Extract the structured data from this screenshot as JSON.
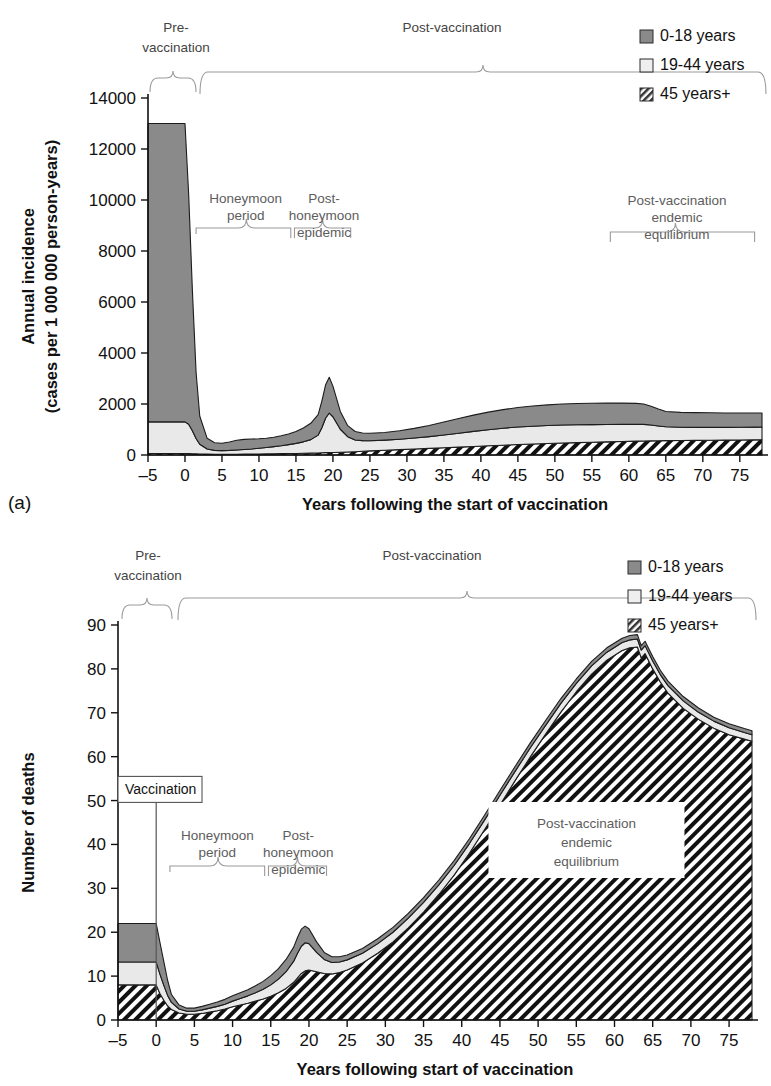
{
  "figure": {
    "panels": [
      {
        "id": "a",
        "label": "(a)",
        "xlabel": "Years following the start of vaccination",
        "ylabel_line1": "Annual incidence",
        "ylabel_line2": "(cases per 1 000 000 person-years)",
        "yticks": [
          0,
          2000,
          4000,
          6000,
          8000,
          10000,
          12000,
          14000
        ],
        "xticks": [
          -5,
          0,
          5,
          10,
          15,
          20,
          25,
          30,
          35,
          40,
          45,
          50,
          55,
          60,
          65,
          70,
          75
        ],
        "annotations": {
          "pre": "Pre-\nvaccination",
          "pre_l1": "Pre-",
          "pre_l2": "vaccination",
          "post": "Post-vaccination",
          "honeymoon_l1": "Honeymoon",
          "honeymoon_l2": "period",
          "posthoney_l1": "Post-",
          "posthoney_l2": "honeymoon",
          "posthoney_l3": "epidemic",
          "endemic_l1": "Post-vaccination",
          "endemic_l2": "endemic",
          "endemic_l3": "equilibrium"
        }
      },
      {
        "id": "b",
        "label": "(b)",
        "xlabel": "Years following start of vaccination",
        "ylabel": "Number of deaths",
        "yticks": [
          0,
          10,
          20,
          30,
          40,
          50,
          60,
          70,
          80,
          90
        ],
        "xticks": [
          -5,
          0,
          5,
          10,
          15,
          20,
          25,
          30,
          35,
          40,
          45,
          50,
          55,
          60,
          65,
          70,
          75
        ],
        "annotations": {
          "pre_l1": "Pre-",
          "pre_l2": "vaccination",
          "post": "Post-vaccination",
          "vaccination_box": "Vaccination",
          "honeymoon_l1": "Honeymoon",
          "honeymoon_l2": "period",
          "posthoney_l1": "Post-",
          "posthoney_l2": "honeymoon",
          "posthoney_l3": "epidemic",
          "endemic_l1": "Post-vaccination",
          "endemic_l2": "endemic",
          "endemic_l3": "equilibrium"
        }
      }
    ],
    "legend": {
      "items": [
        {
          "label": "0-18 years",
          "swatch": "solid-gray",
          "color": "#8a8a8a"
        },
        {
          "label": "19-44 years",
          "swatch": "empty-white",
          "color": "#ececec"
        },
        {
          "label": "45 years+",
          "swatch": "hatched",
          "color": "#ffffff"
        }
      ]
    },
    "colors": {
      "series_0_18": "#8a8a8a",
      "series_19_44": "#e9e9e9",
      "series_45_plus": "#ffffff",
      "hatch_stroke": "#111111",
      "axis": "#111111",
      "annotation_text": "#5d5d5d"
    }
  },
  "chart_data": [
    {
      "type": "area",
      "stacked": true,
      "panel": "a",
      "title": "",
      "xlabel": "Years following the start of vaccination",
      "ylabel": "Annual incidence (cases per 1 000 000 person-years)",
      "xlim": [
        -5,
        78
      ],
      "ylim": [
        0,
        14000
      ],
      "grid": false,
      "legend_position": "top-right",
      "x": [
        -5,
        -4,
        -3,
        -2,
        -1,
        0,
        0.5,
        1,
        1.5,
        2,
        3,
        4,
        5,
        6,
        7,
        8,
        9,
        10,
        11,
        12,
        13,
        14,
        15,
        16,
        17,
        18,
        18.5,
        19,
        19.5,
        20,
        21,
        22,
        23,
        24,
        25,
        27,
        29,
        31,
        33,
        35,
        37,
        39,
        41,
        43,
        45,
        47,
        49,
        51,
        53,
        55,
        57,
        59,
        61,
        62,
        63,
        64,
        65,
        67,
        69,
        71,
        73,
        75,
        77,
        78
      ],
      "series": [
        {
          "name": "45 years+",
          "swatch": "hatched",
          "values": [
            60,
            60,
            60,
            60,
            60,
            60,
            55,
            50,
            45,
            40,
            35,
            30,
            30,
            30,
            32,
            34,
            36,
            40,
            44,
            48,
            52,
            56,
            60,
            66,
            72,
            80,
            86,
            92,
            96,
            100,
            110,
            120,
            130,
            145,
            160,
            185,
            210,
            235,
            260,
            285,
            310,
            335,
            360,
            385,
            410,
            430,
            450,
            470,
            485,
            500,
            515,
            530,
            545,
            550,
            555,
            560,
            565,
            570,
            575,
            580,
            585,
            590,
            595,
            600
          ]
        },
        {
          "name": "19-44 years",
          "swatch": "empty-white",
          "values": [
            1240,
            1240,
            1240,
            1240,
            1240,
            1240,
            1150,
            900,
            600,
            380,
            200,
            150,
            140,
            150,
            165,
            180,
            200,
            225,
            250,
            280,
            310,
            350,
            395,
            450,
            530,
            700,
            980,
            1350,
            1550,
            1400,
            900,
            600,
            460,
            420,
            400,
            400,
            410,
            430,
            460,
            500,
            545,
            590,
            630,
            665,
            690,
            700,
            705,
            705,
            700,
            690,
            680,
            670,
            660,
            650,
            620,
            580,
            540,
            520,
            510,
            505,
            500,
            500,
            500,
            500
          ]
        },
        {
          "name": "0-18 years",
          "swatch": "solid-gray",
          "values": [
            11700,
            11700,
            11700,
            11700,
            11700,
            11700,
            9000,
            5500,
            2600,
            1100,
            420,
            300,
            290,
            330,
            380,
            400,
            390,
            370,
            360,
            370,
            390,
            420,
            470,
            540,
            640,
            800,
            1050,
            1300,
            1400,
            1200,
            700,
            430,
            330,
            300,
            290,
            300,
            330,
            380,
            440,
            510,
            580,
            640,
            690,
            730,
            760,
            790,
            810,
            825,
            835,
            840,
            840,
            835,
            820,
            800,
            740,
            660,
            600,
            580,
            575,
            570,
            565,
            560,
            555,
            550
          ]
        }
      ],
      "annotations": [
        {
          "text": "Pre-vaccination",
          "x_span": [
            -5.5,
            1.5
          ],
          "type": "brace-top"
        },
        {
          "text": "Post-vaccination",
          "x_span": [
            1.5,
            78
          ],
          "type": "brace-top"
        },
        {
          "text": "Honeymoon period",
          "x_span": [
            2,
            15
          ],
          "type": "brace-inner",
          "y": 6800
        },
        {
          "text": "Post-honeymoon epidemic",
          "x_span": [
            15,
            22
          ],
          "type": "brace-inner",
          "y": 6800
        },
        {
          "text": "Post-vaccination endemic equilibrium",
          "x_span": [
            57,
            78
          ],
          "type": "brace-inner",
          "y": 6900
        }
      ]
    },
    {
      "type": "area",
      "stacked": true,
      "panel": "b",
      "title": "",
      "xlabel": "Years following start of vaccination",
      "ylabel": "Number of deaths",
      "xlim": [
        -5,
        78
      ],
      "ylim": [
        0,
        90
      ],
      "grid": false,
      "legend_position": "top-right",
      "x": [
        -5,
        -4,
        -3,
        -2,
        -1,
        0,
        0.5,
        1,
        1.5,
        2,
        3,
        4,
        5,
        6,
        7,
        8,
        9,
        10,
        11,
        12,
        13,
        14,
        15,
        16,
        17,
        18,
        18.5,
        19,
        19.5,
        20,
        21,
        22,
        23,
        24,
        25,
        27,
        29,
        31,
        33,
        35,
        37,
        39,
        41,
        43,
        45,
        47,
        49,
        51,
        53,
        55,
        57,
        59,
        61,
        62,
        63,
        63.5,
        64,
        65,
        66,
        67,
        69,
        71,
        73,
        75,
        77,
        78
      ],
      "series": [
        {
          "name": "45 years+",
          "swatch": "hatched",
          "values": [
            8.0,
            8.0,
            8.0,
            8.0,
            8.0,
            8.0,
            6.0,
            4.5,
            3.2,
            2.4,
            1.6,
            1.3,
            1.3,
            1.5,
            1.8,
            2.1,
            2.5,
            3.0,
            3.4,
            3.8,
            4.3,
            4.8,
            5.4,
            6.2,
            7.2,
            8.6,
            9.6,
            10.6,
            11.2,
            11.4,
            11.0,
            10.6,
            10.5,
            10.8,
            11.4,
            13.0,
            15.2,
            17.8,
            21.0,
            24.6,
            28.6,
            33.0,
            38.0,
            43.4,
            49.0,
            54.6,
            60.0,
            65.2,
            70.2,
            74.8,
            78.8,
            82.0,
            84.2,
            84.8,
            85.0,
            82.5,
            83.5,
            80.0,
            77.0,
            74.5,
            71.0,
            68.5,
            66.5,
            65.0,
            64.0,
            63.5
          ]
        },
        {
          "name": "19-44 years",
          "swatch": "empty-white",
          "values": [
            5.2,
            5.2,
            5.2,
            5.2,
            5.2,
            5.2,
            4.4,
            3.4,
            2.4,
            1.6,
            0.9,
            0.7,
            0.7,
            0.8,
            0.9,
            1.0,
            1.1,
            1.3,
            1.5,
            1.7,
            1.9,
            2.2,
            2.6,
            3.1,
            3.8,
            4.8,
            5.6,
            6.2,
            6.4,
            6.0,
            4.4,
            3.2,
            2.6,
            2.4,
            2.3,
            2.2,
            2.2,
            2.2,
            2.2,
            2.2,
            2.2,
            2.2,
            2.2,
            2.2,
            2.2,
            2.1,
            2.1,
            2.0,
            2.0,
            1.9,
            1.9,
            1.8,
            1.8,
            1.8,
            1.8,
            1.8,
            1.8,
            1.8,
            1.7,
            1.7,
            1.7,
            1.6,
            1.6,
            1.6,
            1.5,
            1.5
          ]
        },
        {
          "name": "0-18 years",
          "swatch": "solid-gray",
          "values": [
            8.8,
            8.8,
            8.8,
            8.8,
            8.8,
            8.8,
            7.2,
            5.4,
            3.4,
            1.8,
            0.9,
            0.7,
            0.7,
            0.8,
            0.9,
            1.0,
            1.1,
            1.2,
            1.3,
            1.4,
            1.6,
            1.8,
            2.1,
            2.4,
            2.8,
            3.2,
            3.6,
            3.9,
            3.8,
            3.4,
            2.4,
            1.6,
            1.3,
            1.2,
            1.1,
            1.1,
            1.1,
            1.1,
            1.1,
            1.1,
            1.1,
            1.1,
            1.1,
            1.1,
            1.1,
            1.1,
            1.1,
            1.1,
            1.1,
            1.0,
            1.0,
            1.0,
            1.0,
            1.0,
            1.0,
            1.0,
            1.0,
            1.0,
            1.0,
            1.0,
            1.0,
            1.0,
            0.9,
            0.9,
            0.9,
            0.9
          ]
        }
      ],
      "annotations": [
        {
          "text": "Pre-vaccination",
          "x_span": [
            -5.5,
            1.5
          ],
          "type": "brace-top"
        },
        {
          "text": "Post-vaccination",
          "x_span": [
            1.5,
            78
          ],
          "type": "brace-top"
        },
        {
          "text": "Vaccination",
          "x": 0,
          "type": "callout-box"
        },
        {
          "text": "Honeymoon period",
          "x_span": [
            2,
            15
          ],
          "type": "brace-inner",
          "y": 60
        },
        {
          "text": "Post-honeymoon epidemic",
          "x_span": [
            15,
            22
          ],
          "type": "brace-inner",
          "y": 60
        },
        {
          "text": "Post-vaccination endemic equilibrium",
          "x": 55,
          "type": "white-box",
          "y": 37
        }
      ]
    }
  ]
}
